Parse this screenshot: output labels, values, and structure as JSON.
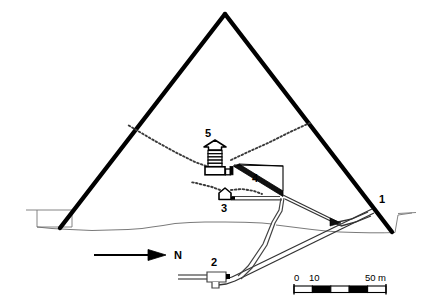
{
  "figure": {
    "type": "cross-section-diagram",
    "background_color": "#ffffff",
    "line_color": "#000000",
    "thin_line_color": "#555555"
  },
  "callouts": [
    {
      "id": "1",
      "label": "1",
      "name": "entrance",
      "x": 382,
      "y": 203
    },
    {
      "id": "2",
      "label": "2",
      "name": "subterranean-chamber",
      "x": 214,
      "y": 262
    },
    {
      "id": "3",
      "label": "3",
      "name": "queens-chamber",
      "x": 224,
      "y": 210
    },
    {
      "id": "4",
      "label": "4",
      "name": "grand-gallery",
      "x": 255,
      "y": 180
    },
    {
      "id": "5",
      "label": "5",
      "name": "kings-chamber",
      "x": 208,
      "y": 132
    }
  ],
  "north_arrow": {
    "label": "N",
    "direction": "right"
  },
  "scale_bar": {
    "unit": "m",
    "ticks": [
      {
        "label": "0",
        "value": 0
      },
      {
        "label": "10",
        "value": 10
      },
      {
        "label": "50 m",
        "value": 50
      }
    ],
    "segments": 5,
    "segment_length": 10,
    "total": 50
  }
}
